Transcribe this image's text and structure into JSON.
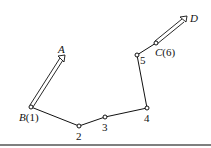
{
  "diagram": {
    "labels": {
      "A": "A",
      "B": "B",
      "B_num": "(1)",
      "n2": "2",
      "n3": "3",
      "n4": "4",
      "n5": "5",
      "C": "C",
      "C_num": "(6)",
      "D": "D"
    },
    "nodes": [
      {
        "id": "B(1)",
        "x": 31,
        "y": 107
      },
      {
        "id": "2",
        "x": 79,
        "y": 126
      },
      {
        "id": "3",
        "x": 105,
        "y": 117
      },
      {
        "id": "4",
        "x": 147,
        "y": 108
      },
      {
        "id": "5",
        "x": 137,
        "y": 55
      },
      {
        "id": "C(6)",
        "x": 156,
        "y": 43
      }
    ],
    "arrows": [
      {
        "from": "B(1)",
        "to": "A",
        "style": "double-line"
      },
      {
        "from": "C(6)",
        "to": "D",
        "style": "double-line"
      }
    ],
    "line_color": "#111111"
  }
}
